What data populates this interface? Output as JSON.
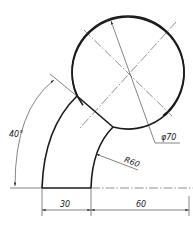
{
  "drawing": {
    "type": "engineering-drawing",
    "dimensions": {
      "angle": "40°",
      "diameter": "φ70",
      "radius": "R60",
      "width_bottom": "30",
      "offset_right": "60"
    },
    "colors": {
      "line": "#1a1a1a",
      "background": "#ffffff"
    }
  }
}
